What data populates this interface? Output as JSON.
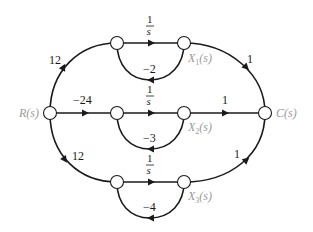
{
  "diagram": {
    "type": "signal-flow-graph",
    "nodes": {
      "input": "R(s)",
      "output": "C(s)",
      "x1": "X",
      "x1_sub": "1",
      "x1_arg": "(s)",
      "x2": "X",
      "x2_sub": "2",
      "x2_arg": "(s)",
      "x3": "X",
      "x3_sub": "3",
      "x3_arg": "(s)"
    },
    "gains": {
      "r_to_top": "12",
      "r_to_mid": "−24",
      "r_to_bot": "12",
      "integrator_num": "1",
      "integrator_den": "s",
      "loop_top": "−2",
      "loop_mid": "−3",
      "loop_bot": "−4",
      "x1_to_c": "1",
      "x2_to_c": "1",
      "x3_to_c": "1"
    }
  }
}
